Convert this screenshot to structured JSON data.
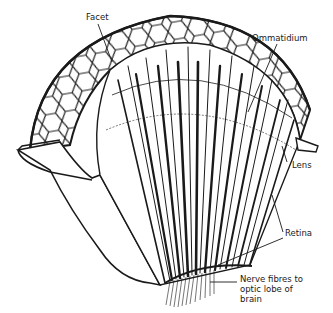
{
  "diagram": {
    "labels": {
      "facet": "Facet",
      "ommatidium": "Ommatidium",
      "lens": "Lens",
      "retina": "Retina",
      "nerve_line1": "Nerve fibres to",
      "nerve_line2": "optic lobe of",
      "nerve_line3": "brain"
    },
    "colors": {
      "ink": "#1a1a1a",
      "background": "#ffffff"
    }
  }
}
